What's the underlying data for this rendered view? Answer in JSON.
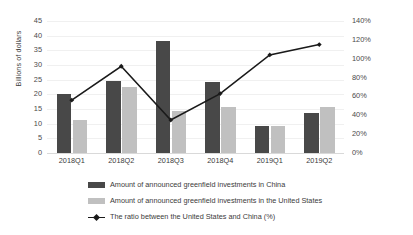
{
  "chart_data": {
    "type": "bar",
    "title": "",
    "subtitle": "",
    "xlabel": "",
    "ylabel": "Billions of dollars",
    "y2label": "",
    "categories": [
      "2018Q1",
      "2018Q2",
      "2018Q3",
      "2018Q4",
      "2019Q1",
      "2019Q2"
    ],
    "ylim": [
      0,
      45
    ],
    "yticks": [
      "0",
      "5",
      "10",
      "15",
      "20",
      "25",
      "30",
      "35",
      "40",
      "45"
    ],
    "y2lim": [
      0,
      140
    ],
    "y2ticks": [
      "0%",
      "20%",
      "40%",
      "60%",
      "80%",
      "100%",
      "120%",
      "140%"
    ],
    "grid": true,
    "legend_position": "bottom",
    "series": [
      {
        "name": "Amount of announced greenfield investments in China",
        "type": "bar",
        "axis": "left",
        "color": "#484848",
        "values": [
          20.0,
          24.6,
          38.2,
          24.2,
          9.1,
          13.8
        ]
      },
      {
        "name": "Amount of announced greenfield investments in the United States",
        "type": "bar",
        "axis": "left",
        "color": "#c0c0c0",
        "values": [
          11.3,
          22.5,
          14.2,
          15.8,
          9.3,
          15.7
        ]
      },
      {
        "name": "The ratio between the United States and China (%)",
        "type": "line",
        "axis": "right",
        "color": "#1a1a1a",
        "values": [
          56,
          92,
          35,
          63,
          104,
          115
        ]
      }
    ]
  },
  "colors": {
    "china_bar": "#484848",
    "usa_bar": "#c0c0c0",
    "ratio_line": "#1a1a1a",
    "grid": "#f0f0f0",
    "axis": "#d9d9d9",
    "text": "#3b3b3b",
    "background": "#ffffff"
  }
}
